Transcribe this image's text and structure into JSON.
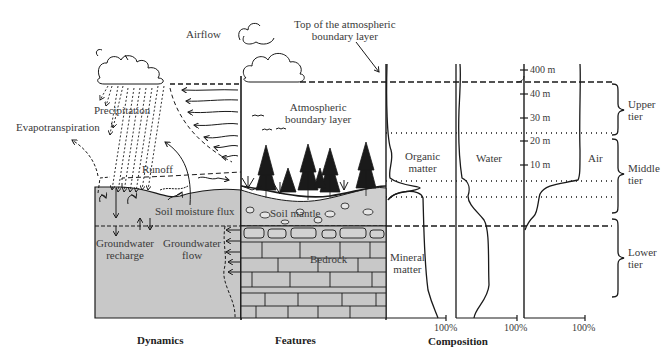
{
  "diagram": {
    "type": "critical-zone-cross-section",
    "panels": {
      "dynamics": {
        "title": "Dynamics"
      },
      "features": {
        "title": "Features"
      },
      "composition": {
        "title": "Composition"
      }
    },
    "dynamics_labels": {
      "airflow": "Airflow",
      "precipitation": "Precipitation",
      "evapotranspiration": "Evapotranspiration",
      "runoff": "Runoff",
      "soil_moisture_flux": "Soil moisture flux",
      "groundwater_recharge_1": "Groundwater",
      "groundwater_recharge_2": "recharge",
      "groundwater_flow_1": "Groundwater",
      "groundwater_flow_2": "flow"
    },
    "features_labels": {
      "top_abl_1": "Top of the atmospheric",
      "top_abl_2": "boundary layer",
      "abl_1": "Atmospheric",
      "abl_2": "boundary layer",
      "soil_mantle": "Soil mantle",
      "bedrock": "Bedrock"
    },
    "composition_labels": {
      "organic_1": "Organic",
      "organic_2": "matter",
      "mineral_1": "Mineral",
      "mineral_2": "matter",
      "water": "Water",
      "air": "Air",
      "axis_max_1": "100%",
      "axis_max_2": "100%",
      "axis_max_3": "100%"
    },
    "height_scale": {
      "ticks": [
        "400 m",
        "40 m",
        "30 m",
        "20 m",
        "10 m"
      ]
    },
    "tiers": [
      {
        "line1": "Upper",
        "line2": "tier"
      },
      {
        "line1": "Middle",
        "line2": "tier"
      },
      {
        "line1": "Lower",
        "line2": "tier"
      }
    ],
    "colors": {
      "ink": "#1a1a1a",
      "ground_fill": "#c8c8c8",
      "text": "#3a3a3a"
    }
  }
}
